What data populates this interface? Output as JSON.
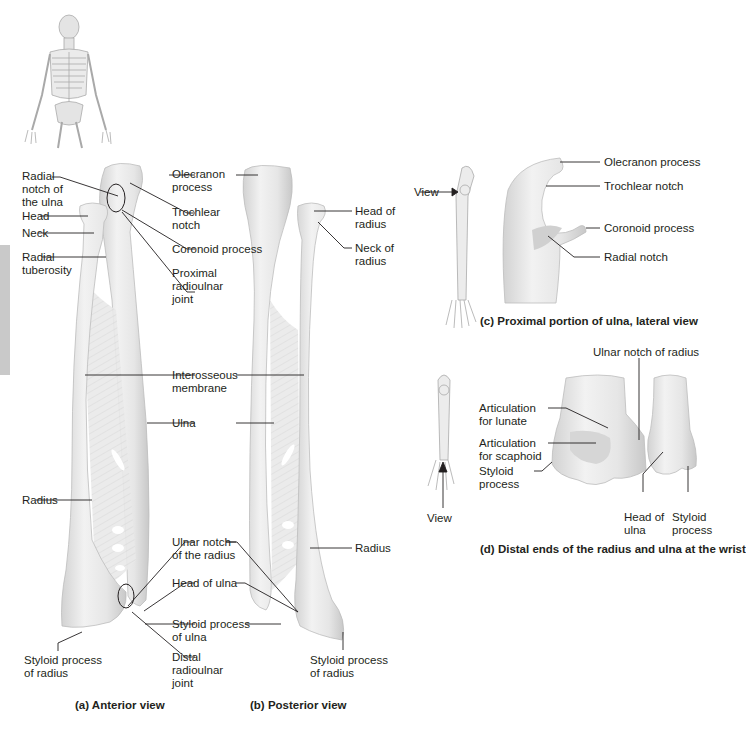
{
  "figure": {
    "panels": [
      {
        "id": "a",
        "caption": "(a) Anterior view"
      },
      {
        "id": "b",
        "caption": "(b) Posterior view"
      },
      {
        "id": "c",
        "caption": "(c) Proximal portion of ulna, lateral view"
      },
      {
        "id": "d",
        "caption": "(d) Distal ends of the radius and ulna at the wrist"
      }
    ],
    "colors": {
      "bone": "#ececec",
      "bone_shade": "#cfcfcf",
      "leader": "#231f20",
      "side_tab": "#c9c9c9"
    }
  },
  "anterior": {
    "labels": {
      "radial_notch": "Radial\nnotch of\nthe ulna",
      "head": "Head",
      "neck": "Neck",
      "radial_tuberosity": "Radial\ntuberosity",
      "olecranon": "Olecranon\nprocess",
      "trochlear_notch": "Trochlear\nnotch",
      "coronoid": "Coronoid process",
      "proximal_joint": "Proximal\nradioulnar\njoint",
      "interosseous": "Interosseous\nmembrane",
      "ulna": "Ulna",
      "radius": "Radius",
      "ulnar_notch": "Ulnar notch\nof the radius",
      "head_of_ulna": "Head of ulna",
      "styloid_ulna": "Styloid process\nof ulna",
      "distal_joint": "Distal\nradioulnar\njoint",
      "styloid_radius": "Styloid process\nof radius"
    }
  },
  "posterior": {
    "labels": {
      "head_of_radius": "Head of\nradius",
      "neck_of_radius": "Neck of\nradius",
      "radius": "Radius",
      "styloid_radius": "Styloid process\nof radius"
    }
  },
  "lateral": {
    "view_label": "View",
    "labels": {
      "olecranon": "Olecranon process",
      "trochlear_notch": "Trochlear notch",
      "coronoid": "Coronoid process",
      "radial_notch": "Radial notch"
    }
  },
  "distal": {
    "view_label": "View",
    "labels": {
      "ulnar_notch": "Ulnar notch of radius",
      "lunate": "Articulation\nfor lunate",
      "scaphoid": "Articulation\nfor scaphoid",
      "styloid": "Styloid\nprocess",
      "head_of_ulna": "Head of\nulna",
      "styloid_ulna": "Styloid\nprocess"
    }
  }
}
